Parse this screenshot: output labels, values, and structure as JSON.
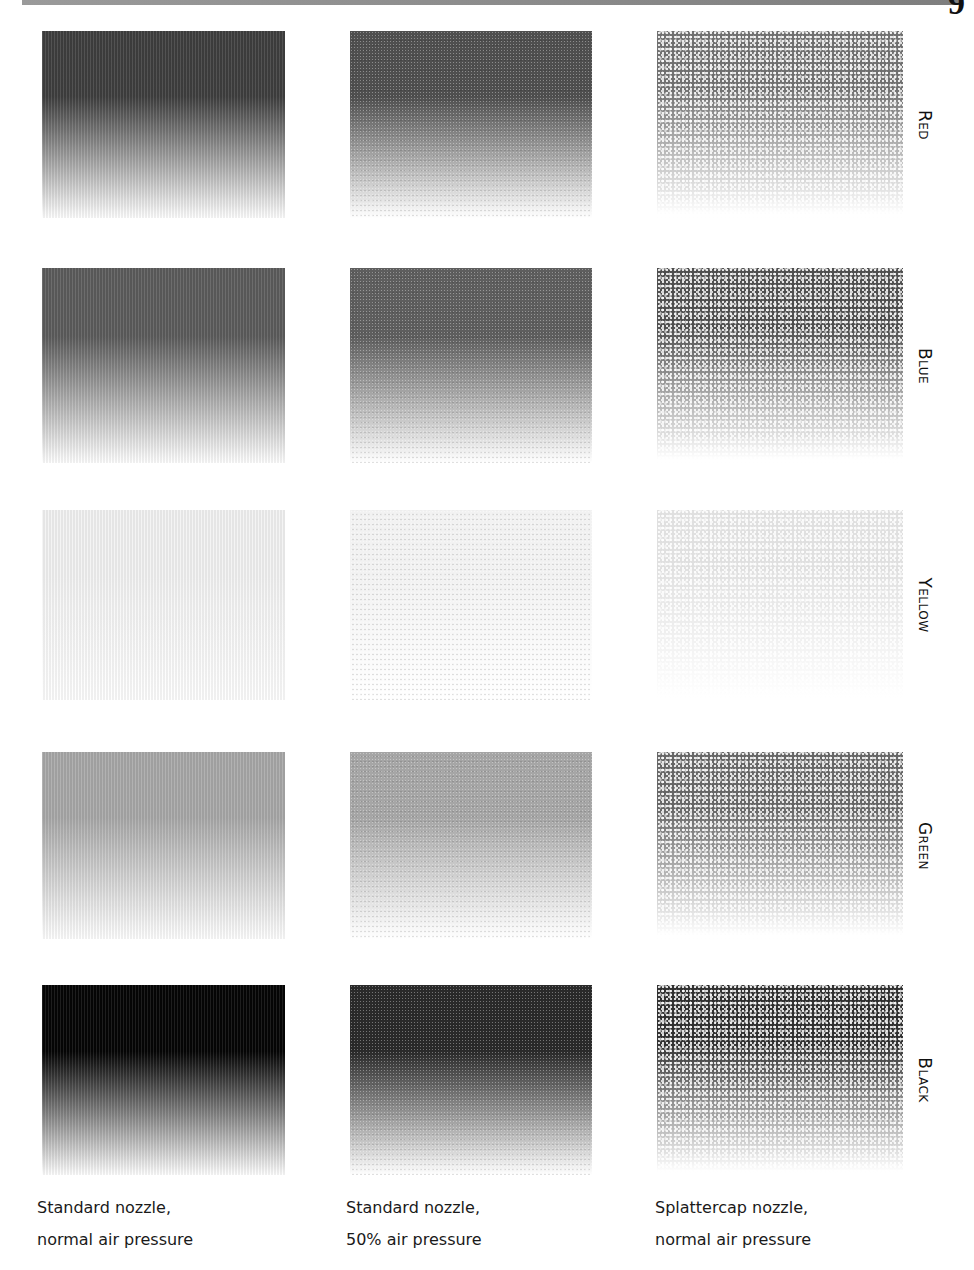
{
  "page": {
    "page_glyph": "9",
    "columns": [
      {
        "id": "standard-normal",
        "caption_line1": "Standard nozzle,",
        "caption_line2": "normal air pressure"
      },
      {
        "id": "standard-half",
        "caption_line1": "Standard nozzle,",
        "caption_line2": "50% air pressure"
      },
      {
        "id": "splattercap-normal",
        "caption_line1": "Splattercap nozzle,",
        "caption_line2": "normal air pressure"
      }
    ],
    "rows": [
      {
        "label": "Red",
        "tones": {
          "standard": "#3f3f3f",
          "half": "#4f4f4f",
          "splatter": "#555555"
        }
      },
      {
        "label": "Blue",
        "tones": {
          "standard": "#5c5c5c",
          "half": "#5e5e5e",
          "splatter": "#2e2e2e"
        }
      },
      {
        "label": "Yellow",
        "tones": {
          "standard": "#f3f3f3",
          "half": "#f2f2f2",
          "splatter": "#dadada"
        }
      },
      {
        "label": "Green",
        "tones": {
          "standard": "#a9a9a9",
          "half": "#a6a6a6",
          "splatter": "#4a4a4a"
        }
      },
      {
        "label": "Black",
        "tones": {
          "standard": "#050505",
          "half": "#2a2a2a",
          "splatter": "#0a0a0a"
        }
      }
    ]
  }
}
